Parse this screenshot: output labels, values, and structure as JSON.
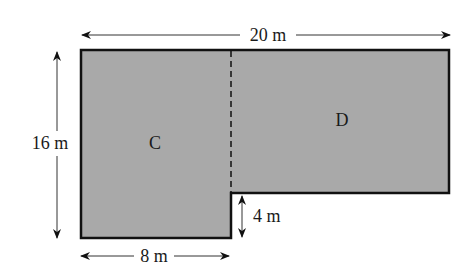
{
  "diagram": {
    "type": "composite-area-figure",
    "shape_fill_color": "#a9a9a9",
    "outline_color": "#111111",
    "regions": [
      {
        "id": "C",
        "label": "C"
      },
      {
        "id": "D",
        "label": "D"
      }
    ],
    "dimensions": {
      "total_width": "20 m",
      "total_height": "16 m",
      "bottom_width": "8 m",
      "notch_height": "4 m"
    }
  }
}
